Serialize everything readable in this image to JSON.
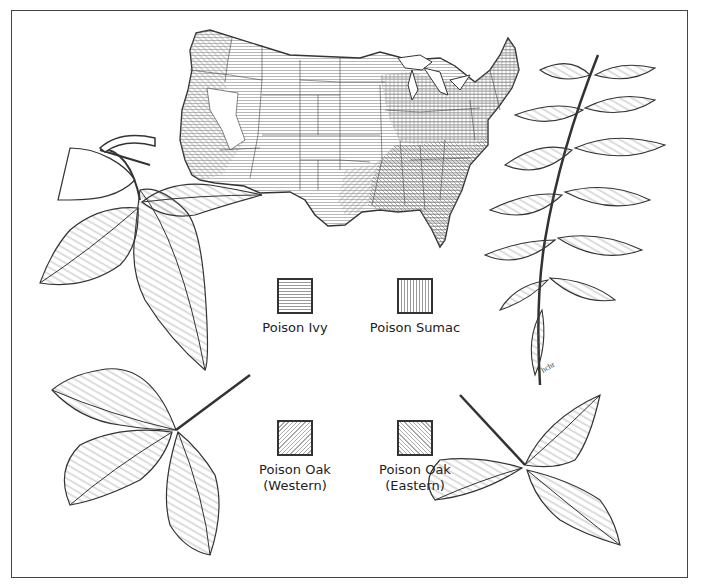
{
  "figure": {
    "signature": "hchr"
  },
  "legend": {
    "items": [
      {
        "label": "Poison Ivy",
        "sublabel": "",
        "pattern": "horizontal-lines"
      },
      {
        "label": "Poison Sumac",
        "sublabel": "",
        "pattern": "vertical-lines"
      },
      {
        "label": "Poison Oak",
        "sublabel": "(Western)",
        "pattern": "diagonal-right"
      },
      {
        "label": "Poison Oak",
        "sublabel": "(Eastern)",
        "pattern": "diagonal-left"
      }
    ]
  },
  "illustrations": {
    "top_left": "poison-ivy-leaf",
    "top_right": "poison-sumac-leaf",
    "bottom_left": "western-poison-oak-leaf",
    "bottom_right": "eastern-poison-oak-leaf",
    "center_top": "us-range-map"
  },
  "colors": {
    "ink": "#333333",
    "paper": "#ffffff",
    "hatch": "#888888"
  }
}
